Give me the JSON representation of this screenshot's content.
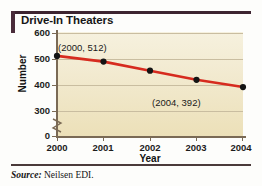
{
  "figure": {
    "title": "Drive-In Theaters",
    "source_label": "Source:",
    "source_value": "Neilsen EDI."
  },
  "colors": {
    "accent_bar": "#4a2c3a",
    "rule": "#3d2430",
    "line": "#d62b1f",
    "marker": "#141414",
    "plot_background": "#f2ead0",
    "gridline": "#c9bda0",
    "axis": "#7a6a55"
  },
  "chart_data": {
    "type": "line",
    "title": "Drive-In Theaters",
    "xlabel": "Year",
    "ylabel": "Number",
    "x": [
      2000,
      2001,
      2002,
      2003,
      2004
    ],
    "xticklabels": [
      "2000",
      "2001",
      "2002",
      "2003",
      "2004"
    ],
    "values": [
      512,
      490,
      455,
      420,
      392
    ],
    "yticks": [
      0,
      300,
      400,
      500,
      600
    ],
    "yticklabels": [
      "0",
      "300",
      "400",
      "500",
      "600"
    ],
    "ylim": [
      300,
      600
    ],
    "xlim": [
      2000,
      2004
    ],
    "axis_break": true,
    "grid": true,
    "legend": "none",
    "annotations": [
      {
        "text": "(2000, 512)",
        "x": 2000,
        "y": 512
      },
      {
        "text": "(2004, 392)",
        "x": 2004,
        "y": 392
      }
    ],
    "series": [
      {
        "name": "Drive-In Theaters",
        "values": [
          512,
          490,
          455,
          420,
          392
        ],
        "color": "#d62b1f",
        "marker": "circle"
      }
    ]
  }
}
